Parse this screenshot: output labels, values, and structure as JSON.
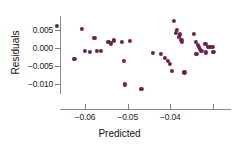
{
  "chart_data": {
    "type": "scatter",
    "title": "",
    "xlabel": "Predicted",
    "ylabel": "Residuals",
    "xlim": [
      -0.0685,
      -0.0285
    ],
    "ylim": [
      -0.0125,
      0.0082
    ],
    "grid": false,
    "legend": null,
    "marker_color": "#6b2352",
    "axis_color": "#8a8a8a",
    "xticks": [
      -0.06,
      -0.05,
      -0.04,
      -0.03
    ],
    "xticklabels": [
      "-0.06",
      "-0.05",
      "-0.04",
      ""
    ],
    "yticks": [
      0.005,
      0.0,
      -0.005,
      -0.01
    ],
    "yticklabels": [
      "0.005",
      "0.000",
      "-0.005",
      "-0.010"
    ],
    "points": [
      {
        "x": -0.0665,
        "y": 0.0062
      },
      {
        "x": -0.0625,
        "y": -0.003
      },
      {
        "x": -0.0607,
        "y": 0.0053
      },
      {
        "x": -0.06,
        "y": -0.0007
      },
      {
        "x": -0.0589,
        "y": -0.001
      },
      {
        "x": -0.0578,
        "y": 0.0027
      },
      {
        "x": -0.0573,
        "y": -0.0007
      },
      {
        "x": -0.0562,
        "y": -0.0009
      },
      {
        "x": -0.0545,
        "y": 0.0018
      },
      {
        "x": -0.0539,
        "y": 0.0013
      },
      {
        "x": -0.0533,
        "y": 0.0021
      },
      {
        "x": -0.0513,
        "y": 0.0017
      },
      {
        "x": -0.0508,
        "y": -0.0036
      },
      {
        "x": -0.0506,
        "y": -0.0101
      },
      {
        "x": -0.0495,
        "y": 0.002
      },
      {
        "x": -0.0468,
        "y": -0.0113
      },
      {
        "x": -0.044,
        "y": -0.0013
      },
      {
        "x": -0.0423,
        "y": -0.0017
      },
      {
        "x": -0.0412,
        "y": -0.0027
      },
      {
        "x": -0.0406,
        "y": -0.0035
      },
      {
        "x": -0.0401,
        "y": -0.0044
      },
      {
        "x": -0.0396,
        "y": -0.0063
      },
      {
        "x": -0.0391,
        "y": 0.0075
      },
      {
        "x": -0.0387,
        "y": 0.0041
      },
      {
        "x": -0.0384,
        "y": 0.005
      },
      {
        "x": -0.038,
        "y": 0.003
      },
      {
        "x": -0.0377,
        "y": 0.0038
      },
      {
        "x": -0.0374,
        "y": 0.0022
      },
      {
        "x": -0.0372,
        "y": 0.0016
      },
      {
        "x": -0.0367,
        "y": -0.0068
      },
      {
        "x": -0.0344,
        "y": 0.0039
      },
      {
        "x": -0.034,
        "y": 0.0017
      },
      {
        "x": -0.0336,
        "y": 0.0009
      },
      {
        "x": -0.0333,
        "y": 0.0004
      },
      {
        "x": -0.033,
        "y": -0.0002
      },
      {
        "x": -0.0327,
        "y": -0.0008
      },
      {
        "x": -0.0339,
        "y": -0.0017
      },
      {
        "x": -0.0316,
        "y": -0.0012
      },
      {
        "x": -0.0312,
        "y": 0.0002
      },
      {
        "x": -0.0306,
        "y": 0.0003
      },
      {
        "x": -0.0301,
        "y": 0.0003
      },
      {
        "x": -0.0299,
        "y": -0.0011
      },
      {
        "x": -0.0318,
        "y": 0.0012
      }
    ]
  }
}
